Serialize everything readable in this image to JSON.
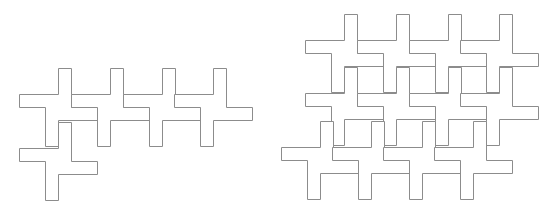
{
  "diagram": {
    "unit": 13,
    "stroke_color": "#8c8c8c",
    "background": "#ffffff",
    "figures": [
      {
        "name": "left-tiling",
        "crosses": [
          {
            "x": 45,
            "y": 94
          },
          {
            "x": 97,
            "y": 94
          },
          {
            "x": 149,
            "y": 94
          },
          {
            "x": 200,
            "y": 94
          },
          {
            "x": 45,
            "y": 148
          }
        ]
      },
      {
        "name": "right-tiling",
        "crosses": [
          {
            "x": 331,
            "y": 40
          },
          {
            "x": 383,
            "y": 40
          },
          {
            "x": 435,
            "y": 40
          },
          {
            "x": 486,
            "y": 40
          },
          {
            "x": 331,
            "y": 93
          },
          {
            "x": 383,
            "y": 93
          },
          {
            "x": 435,
            "y": 93
          },
          {
            "x": 486,
            "y": 93
          },
          {
            "x": 307,
            "y": 147
          },
          {
            "x": 358,
            "y": 147
          },
          {
            "x": 409,
            "y": 147
          },
          {
            "x": 460,
            "y": 147
          }
        ]
      }
    ]
  }
}
